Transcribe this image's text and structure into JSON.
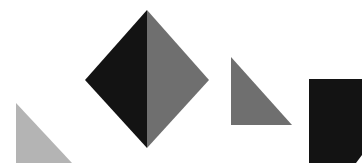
{
  "canvas": {
    "width": 362,
    "height": 163,
    "background": "#ffffff"
  },
  "colors": {
    "dark": "#131313",
    "mid": "#6f6f6f",
    "light": "#b4b4b4"
  },
  "shapes": [
    {
      "name": "diamond-left-half",
      "type": "polygon",
      "points": "147,10 85,80 147,148",
      "fill": "dark"
    },
    {
      "name": "diamond-right-half",
      "type": "polygon",
      "points": "147,10 209,80 147,148",
      "fill": "mid"
    },
    {
      "name": "right-triangle",
      "type": "polygon",
      "points": "231,57 231,125 292,125",
      "fill": "mid"
    },
    {
      "name": "light-triangle",
      "type": "polygon",
      "points": "16,103 16,163 72,163",
      "fill": "light"
    },
    {
      "name": "black-rectangle",
      "type": "polygon",
      "points": "309,79 362,79 362,155 356,163 309,163",
      "fill": "dark"
    }
  ]
}
